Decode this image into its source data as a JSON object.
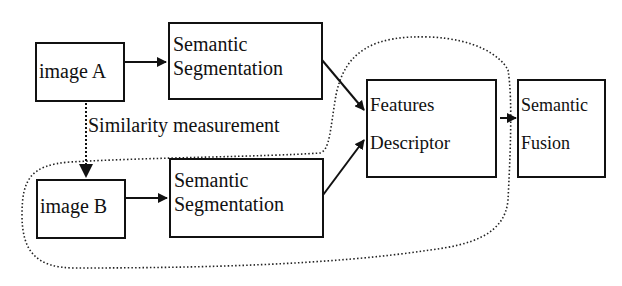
{
  "diagram": {
    "nodes": {
      "image_a": {
        "label": "image A"
      },
      "seg_a": {
        "line1": "Semantic",
        "line2": "Segmentation"
      },
      "image_b": {
        "label": "image B"
      },
      "seg_b": {
        "line1": "Semantic",
        "line2": "Segmentation"
      },
      "features": {
        "line1": "Features",
        "line2": "Descriptor"
      },
      "fusion": {
        "line1": "Semantic",
        "line2": "Fusion"
      }
    },
    "annotations": {
      "similarity": "Similarity measurement"
    },
    "edges": [
      {
        "from": "image_a",
        "to": "seg_a",
        "style": "solid"
      },
      {
        "from": "image_b",
        "to": "seg_b",
        "style": "solid"
      },
      {
        "from": "seg_a",
        "to": "features",
        "style": "solid"
      },
      {
        "from": "seg_b",
        "to": "features",
        "style": "solid"
      },
      {
        "from": "features",
        "to": "fusion",
        "style": "solid"
      },
      {
        "from": "image_a",
        "to": "image_b",
        "style": "dotted"
      }
    ],
    "colors": {
      "stroke": "#111111",
      "background": "#ffffff"
    }
  }
}
